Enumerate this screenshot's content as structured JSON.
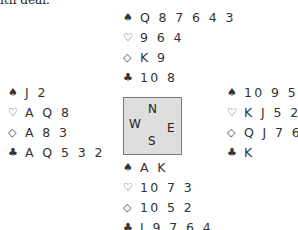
{
  "header": {
    "fragment": "ith deal."
  },
  "symbols": {
    "spades": "♠",
    "hearts": "♡",
    "diamonds": "◇",
    "clubs": "♣"
  },
  "compass": {
    "n": "N",
    "w": "W",
    "e": "E",
    "s": "S"
  },
  "hands": {
    "north": {
      "spades": "Q 8 7 6 4 3",
      "hearts": "9 6 4",
      "diamonds": "K 9",
      "clubs": "10 8"
    },
    "west": {
      "spades": "J 2",
      "hearts": "A Q 8",
      "diamonds": "A 8 3",
      "clubs": "A Q 5 3 2"
    },
    "east": {
      "spades": "10 9 5",
      "hearts": "K J 5 2",
      "diamonds": "Q J 7 6 4",
      "clubs": "K"
    },
    "south": {
      "spades": "A K",
      "hearts": "10 7 3",
      "diamonds": "10 5 2",
      "clubs": "J 9 7 6 4"
    }
  }
}
